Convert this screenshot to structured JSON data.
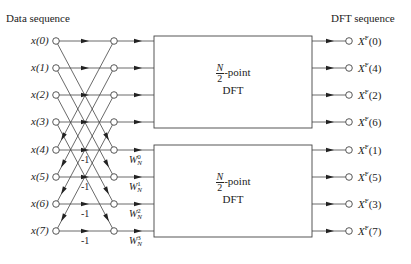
{
  "headers": {
    "left": "Data sequence",
    "right": "DFT sequence"
  },
  "inputs": [
    "x(0)",
    "x(1)",
    "x(2)",
    "x(3)",
    "x(4)",
    "x(5)",
    "x(6)",
    "x(7)"
  ],
  "outputs": [
    {
      "base": "X",
      "sup": "F",
      "idx": "(0)"
    },
    {
      "base": "X",
      "sup": "F",
      "idx": "(4)"
    },
    {
      "base": "X",
      "sup": "F",
      "idx": "(2)"
    },
    {
      "base": "X",
      "sup": "F",
      "idx": "(6)"
    },
    {
      "base": "X",
      "sup": "F",
      "idx": "(1)"
    },
    {
      "base": "X",
      "sup": "F",
      "idx": "(5)"
    },
    {
      "base": "X",
      "sup": "F",
      "idx": "(3)"
    },
    {
      "base": "X",
      "sup": "F",
      "idx": "(7)"
    }
  ],
  "minus_labels": [
    "-1",
    "-1",
    "-1",
    "-1"
  ],
  "twiddles": [
    {
      "base": "W",
      "sub": "N",
      "sup": "0"
    },
    {
      "base": "W",
      "sub": "N",
      "sup": "1"
    },
    {
      "base": "W",
      "sub": "N",
      "sup": "2"
    },
    {
      "base": "W",
      "sub": "N",
      "sup": "3"
    }
  ],
  "boxes": [
    {
      "frac_num": "N",
      "frac_den": "2",
      "suffix": "-point",
      "label": "DFT"
    },
    {
      "frac_num": "N",
      "frac_den": "2",
      "suffix": "-point",
      "label": "DFT"
    }
  ]
}
